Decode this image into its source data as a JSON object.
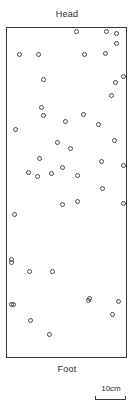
{
  "figure": {
    "head_label": "Head",
    "foot_label": "Foot",
    "scale": {
      "label": "10cm",
      "bar_length_px": 31
    }
  },
  "chart_data": {
    "type": "scatter",
    "title": "",
    "subtitle": "",
    "xlabel": "",
    "ylabel": "",
    "top_annotation": "Head",
    "bottom_annotation": "Foot",
    "scale_bar_label": "10cm",
    "grid": false,
    "legend": null,
    "axis_ticks": [],
    "marker": {
      "shape": "open-circle",
      "size_px": 5,
      "fill": "none",
      "edge_color": "#4a4a4a"
    },
    "plot_frame": {
      "x_px": 6,
      "y_px": 27,
      "width_px": 121,
      "height_px": 331,
      "border_color": "#3a3a3a"
    },
    "xlim": [
      0,
      121
    ],
    "ylim": [
      0,
      331
    ],
    "n_points": 46,
    "points": [
      {
        "x": 69,
        "y": 3
      },
      {
        "x": 99,
        "y": 3
      },
      {
        "x": 109,
        "y": 5
      },
      {
        "x": 109,
        "y": 15
      },
      {
        "x": 12,
        "y": 26
      },
      {
        "x": 31,
        "y": 26
      },
      {
        "x": 77,
        "y": 26
      },
      {
        "x": 98,
        "y": 25
      },
      {
        "x": 116,
        "y": 48
      },
      {
        "x": 36,
        "y": 51
      },
      {
        "x": 108,
        "y": 54
      },
      {
        "x": 104,
        "y": 67
      },
      {
        "x": 34,
        "y": 79
      },
      {
        "x": 36,
        "y": 87
      },
      {
        "x": 58,
        "y": 93
      },
      {
        "x": 76,
        "y": 86
      },
      {
        "x": 91,
        "y": 96
      },
      {
        "x": 107,
        "y": 112
      },
      {
        "x": 32,
        "y": 130
      },
      {
        "x": 21,
        "y": 144
      },
      {
        "x": 30,
        "y": 148
      },
      {
        "x": 44,
        "y": 145
      },
      {
        "x": 55,
        "y": 139
      },
      {
        "x": 70,
        "y": 147
      },
      {
        "x": 94,
        "y": 133
      },
      {
        "x": 116,
        "y": 137
      },
      {
        "x": 55,
        "y": 176
      },
      {
        "x": 116,
        "y": 175
      },
      {
        "x": 7,
        "y": 186
      },
      {
        "x": 4,
        "y": 231
      },
      {
        "x": 4,
        "y": 234
      },
      {
        "x": 22,
        "y": 243
      },
      {
        "x": 45,
        "y": 243
      },
      {
        "x": 4,
        "y": 276
      },
      {
        "x": 82,
        "y": 270
      },
      {
        "x": 111,
        "y": 273
      },
      {
        "x": 6,
        "y": 276
      },
      {
        "x": 81,
        "y": 272
      },
      {
        "x": 105,
        "y": 286
      },
      {
        "x": 23,
        "y": 292
      },
      {
        "x": 42,
        "y": 306
      },
      {
        "x": 8,
        "y": 101
      },
      {
        "x": 50,
        "y": 114
      },
      {
        "x": 63,
        "y": 120
      },
      {
        "x": 70,
        "y": 173
      },
      {
        "x": 95,
        "y": 160
      }
    ]
  }
}
